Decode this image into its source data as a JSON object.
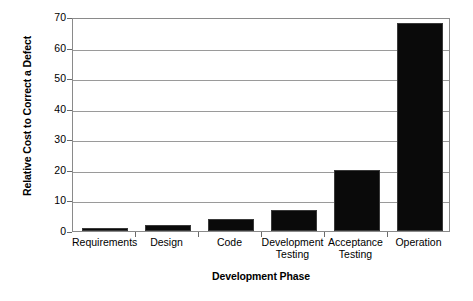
{
  "chart_data": {
    "type": "bar",
    "title": "",
    "xlabel": "Development Phase",
    "ylabel": "Relative Cost to Correct a Defect",
    "categories": [
      "Requirements",
      "Design",
      "Code",
      "Development Testing",
      "Acceptance Testing",
      "Operation"
    ],
    "category_lines": [
      [
        "Requirements"
      ],
      [
        "Design"
      ],
      [
        "Code"
      ],
      [
        "Development",
        "Testing"
      ],
      [
        "Acceptance",
        "Testing"
      ],
      [
        "Operation"
      ]
    ],
    "values": [
      1,
      2,
      4,
      7,
      20,
      68
    ],
    "ylim": [
      0,
      70
    ],
    "ytick_step": 10,
    "yticks": [
      0,
      10,
      20,
      30,
      40,
      50,
      60,
      70
    ],
    "ytick_labels": [
      "0",
      "10",
      "20",
      "30",
      "40",
      "50",
      "60",
      "70"
    ],
    "grid": true,
    "grid_axis": "y",
    "legend": false,
    "bar_color": "#0a0a0a",
    "grid_color": "#9a9a9a",
    "axis_color": "#8a8a8a",
    "plot_background": "#ffffff",
    "series": [
      {
        "name": "Relative Cost to Correct a Defect",
        "values": [
          1,
          2,
          4,
          7,
          20,
          68
        ]
      }
    ]
  }
}
